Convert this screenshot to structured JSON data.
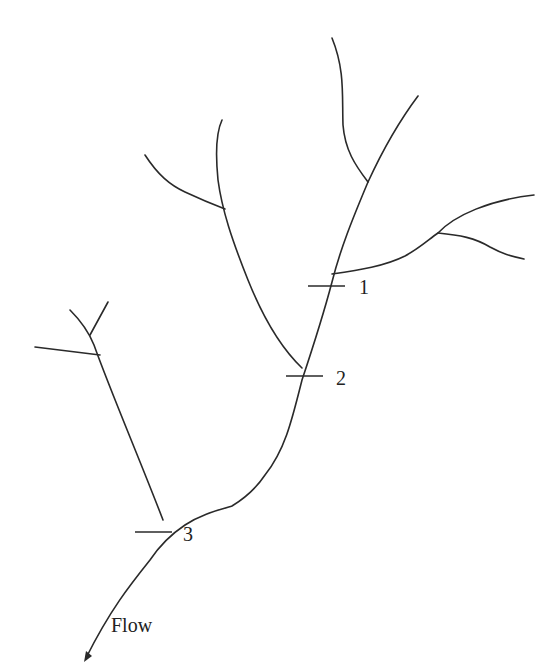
{
  "diagram": {
    "type": "stream-network",
    "stations": [
      {
        "id": "station-1",
        "label": "1"
      },
      {
        "id": "station-2",
        "label": "2"
      },
      {
        "id": "station-3",
        "label": "3"
      }
    ],
    "flow_label": "Flow",
    "colors": {
      "line": "#2a2a2a",
      "text": "#222222",
      "background": "#ffffff"
    }
  }
}
